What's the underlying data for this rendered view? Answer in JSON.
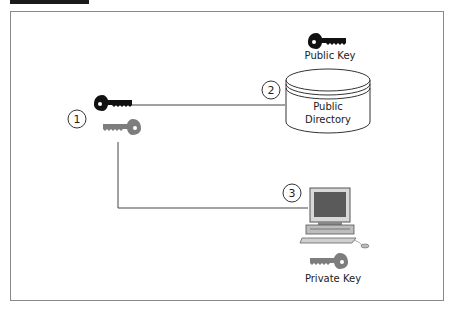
{
  "diagram": {
    "type": "public-key-distribution",
    "nodes": [
      {
        "id": "1",
        "label": "",
        "description": "key pair (public + private key)"
      },
      {
        "id": "2",
        "label": "Public Directory",
        "attached_label": "Public Key"
      },
      {
        "id": "3",
        "label": "",
        "description": "computer",
        "attached_label": "Private Key"
      }
    ],
    "steps": [
      "1",
      "2",
      "3"
    ],
    "labels": {
      "public_key": "Public Key",
      "public_directory_line1": "Public",
      "public_directory_line2": "Directory",
      "private_key": "Private Key"
    },
    "colors": {
      "black_key": "#111111",
      "gray_key": "#7a7a7a",
      "line": "#444444",
      "frame": "#8a8a8a"
    }
  }
}
